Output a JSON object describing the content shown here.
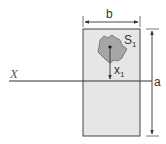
{
  "diagram": {
    "axis_label": "X",
    "width_label": "b",
    "height_label": "a",
    "area_label": "S",
    "area_subscript": "1",
    "distance_label": "x",
    "distance_subscript": "1"
  },
  "colors": {
    "rect_fill": "#e6e6e6",
    "rect_stroke": "#444444",
    "blob_fill": "#a6a6a6",
    "line": "#333333"
  }
}
